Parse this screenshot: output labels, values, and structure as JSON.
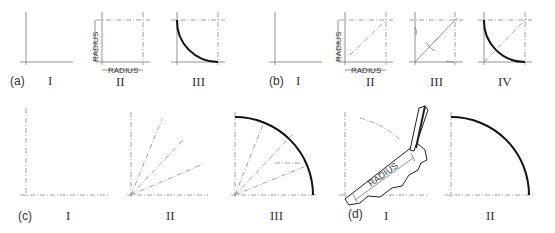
{
  "figure": {
    "panels": [
      {
        "id": "a",
        "label": "(a)",
        "steps": [
          "I",
          "II",
          "III"
        ],
        "dimension_labels": [
          "RADIUS",
          "RADIUS"
        ]
      },
      {
        "id": "b",
        "label": "(b)",
        "steps": [
          "I",
          "II",
          "III",
          "IV"
        ],
        "dimension_labels": [
          "RADIUS",
          "RADIUS"
        ]
      },
      {
        "id": "c",
        "label": "(c)",
        "steps": [
          "I",
          "II",
          "III"
        ]
      },
      {
        "id": "d",
        "label": "(d)",
        "steps": [
          "I",
          "II"
        ],
        "dimension_labels": [
          "RADIUS"
        ]
      }
    ]
  },
  "labels": {
    "a": "(a)",
    "b": "(b)",
    "c": "(c)",
    "d": "(d)",
    "r1": "I",
    "r2": "II",
    "r3": "III",
    "r4": "IV",
    "radius": "RADIUS"
  },
  "colors": {
    "line": "#777777",
    "arc": "#111111",
    "text": "#333333"
  }
}
